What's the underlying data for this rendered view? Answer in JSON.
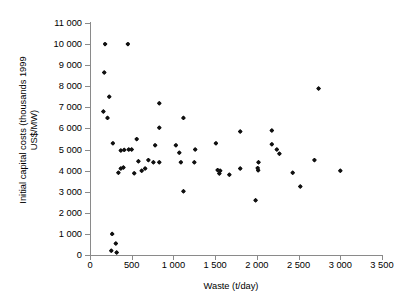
{
  "chart_data": {
    "type": "scatter",
    "title": "",
    "xlabel": "Waste (t/day)",
    "ylabel": "Initial capital costs (thousands 1999 US$/MW)",
    "ylabel_line1": "Initial capital costs (thousands 1999",
    "ylabel_line2": "US$/MW)",
    "xlim": [
      0,
      3500
    ],
    "ylim": [
      0,
      11000
    ],
    "xticks": [
      0,
      500,
      1000,
      1500,
      2000,
      2500,
      3000,
      3500
    ],
    "xticklabels": [
      "0",
      "500",
      "1 000",
      "1 500",
      "2 000",
      "2 500",
      "3 000",
      "3 500"
    ],
    "yticks": [
      0,
      1000,
      2000,
      3000,
      4000,
      5000,
      6000,
      7000,
      8000,
      9000,
      10000,
      11000
    ],
    "yticklabels": [
      "0",
      "1 000",
      "2 000",
      "3 000",
      "4 000",
      "5 000",
      "6 000",
      "7 000",
      "8 000",
      "9 000",
      "10 000",
      "11 000"
    ],
    "grid": false,
    "legend": null,
    "marker": "diamond",
    "marker_color": "#111111",
    "axis_color": "#8a8a8a",
    "series": [
      {
        "name": "Waste-to-energy plants",
        "points": [
          [
            180,
            10000
          ],
          [
            455,
            10000
          ],
          [
            170,
            8650
          ],
          [
            230,
            7500
          ],
          [
            160,
            6800
          ],
          [
            210,
            6500
          ],
          [
            1120,
            6500
          ],
          [
            2740,
            7900
          ],
          [
            830,
            7200
          ],
          [
            830,
            6030
          ],
          [
            2180,
            5900
          ],
          [
            275,
            5300
          ],
          [
            560,
            5500
          ],
          [
            780,
            5200
          ],
          [
            1030,
            5200
          ],
          [
            1510,
            5300
          ],
          [
            1800,
            5850
          ],
          [
            2180,
            5250
          ],
          [
            2240,
            5000
          ],
          [
            370,
            4950
          ],
          [
            410,
            4980
          ],
          [
            465,
            5000
          ],
          [
            500,
            5000
          ],
          [
            1070,
            4850
          ],
          [
            1260,
            5000
          ],
          [
            2270,
            4800
          ],
          [
            580,
            4450
          ],
          [
            700,
            4500
          ],
          [
            760,
            4400
          ],
          [
            830,
            4400
          ],
          [
            1090,
            4400
          ],
          [
            1250,
            4400
          ],
          [
            2020,
            4400
          ],
          [
            2690,
            4500
          ],
          [
            370,
            4100
          ],
          [
            400,
            4150
          ],
          [
            620,
            4000
          ],
          [
            660,
            4100
          ],
          [
            1530,
            4030
          ],
          [
            1560,
            4000
          ],
          [
            1800,
            4100
          ],
          [
            2010,
            4120
          ],
          [
            2015,
            4020
          ],
          [
            2430,
            3900
          ],
          [
            3000,
            4000
          ],
          [
            340,
            3900
          ],
          [
            530,
            3880
          ],
          [
            1550,
            3870
          ],
          [
            1670,
            3800
          ],
          [
            2520,
            3250
          ],
          [
            1120,
            3020
          ],
          [
            1985,
            2600
          ],
          [
            265,
            1000
          ],
          [
            310,
            550
          ],
          [
            255,
            200
          ],
          [
            320,
            120
          ]
        ]
      }
    ]
  }
}
